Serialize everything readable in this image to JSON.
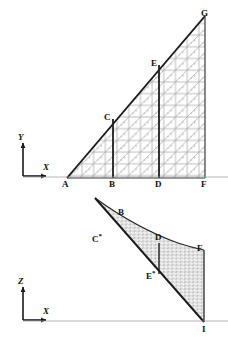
{
  "figure": {
    "panels": [
      {
        "id": "top-panel",
        "name": "xy-plane-triangular-mesh",
        "plane": "XY",
        "axes": {
          "vertical": "Y",
          "horizontal": "X"
        },
        "description": "Right triangle ABFG subdivided into a structured triangular mesh with internal vertical partition lines BC and DE",
        "vertices": [
          {
            "label": "A",
            "x": 67,
            "y": 178,
            "role": "triangle-left-base-corner"
          },
          {
            "label": "B",
            "x": 113,
            "y": 178,
            "role": "base-partition-1"
          },
          {
            "label": "C",
            "x": 109,
            "y": 119,
            "role": "hypotenuse-partition-1"
          },
          {
            "label": "D",
            "x": 159,
            "y": 178,
            "role": "base-partition-2"
          },
          {
            "label": "E",
            "x": 156,
            "y": 65,
            "role": "hypotenuse-partition-2"
          },
          {
            "label": "F",
            "x": 205,
            "y": 178,
            "role": "triangle-right-base-corner"
          },
          {
            "label": "G",
            "x": 205,
            "y": 16,
            "role": "triangle-apex"
          }
        ]
      },
      {
        "id": "bottom-panel",
        "name": "xz-plane-surface-profile",
        "plane": "XZ",
        "axes": {
          "vertical": "Z",
          "horizontal": "X"
        },
        "description": "Curved swept surface mesh bounded above by a concave curve and below by a straight chord terminating at point I",
        "vertices": [
          {
            "label": "B",
            "x": 121,
            "y": 214,
            "role": "curve-upper-marker"
          },
          {
            "label": "C*",
            "x": 96,
            "y": 239,
            "role": "curve-partition-1"
          },
          {
            "label": "D",
            "x": 158,
            "y": 239,
            "role": "curve-partition-2"
          },
          {
            "label": "E*",
            "x": 150,
            "y": 276,
            "role": "lower-chord-partition"
          },
          {
            "label": "F",
            "x": 200,
            "y": 250,
            "role": "surface-right-top"
          },
          {
            "label": "I",
            "x": 204,
            "y": 322,
            "role": "surface-right-bottom"
          }
        ]
      }
    ],
    "axis_labels": {
      "top_vertical": "Y",
      "top_horizontal": "X",
      "bottom_vertical": "Z",
      "bottom_horizontal": "X"
    },
    "node_labels_top": [
      "A",
      "B",
      "C",
      "D",
      "E",
      "F",
      "G"
    ],
    "node_labels_bottom": [
      "B",
      "C",
      "D",
      "E",
      "F",
      "I"
    ],
    "starred_labels": [
      "C*",
      "E*"
    ],
    "mesh": {
      "type": "structured-triangular",
      "columns": 12,
      "rows": 7,
      "cell_size_px": 11.7,
      "diagonal_direction": "lower-left-to-upper-right"
    },
    "colors": {
      "stroke_heavy": "#1a1a1a",
      "stroke_medium": "#4d4d4d",
      "stroke_mesh": "#9a9a9a",
      "stroke_mesh_light": "#bcbcbc",
      "background": "#ffffff",
      "label_text": "#111111"
    }
  }
}
